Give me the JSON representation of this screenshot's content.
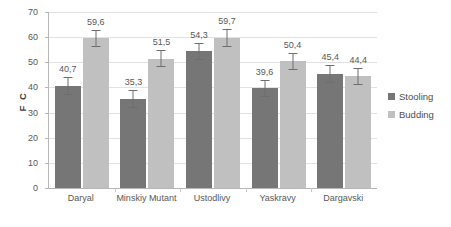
{
  "chart_data": {
    "type": "bar",
    "title": "",
    "xlabel": "",
    "ylabel": "F C",
    "ylim": [
      0,
      70
    ],
    "ytick_step": 10,
    "yticks": [
      0,
      10,
      20,
      30,
      40,
      50,
      60,
      70
    ],
    "ytick_labels": [
      "0",
      "10",
      "20",
      "30",
      "40",
      "50",
      "60",
      "70"
    ],
    "grid": true,
    "grid_axis": "y",
    "legend_position": "right",
    "decimal_separator": ",",
    "categories": [
      "Daryal",
      "Minskiy Mutant",
      "Ustodlivy",
      "Yaskravy",
      "Dargavski"
    ],
    "series": [
      {
        "name": "Stooling",
        "color": "#767676",
        "values": [
          40.7,
          35.3,
          54.3,
          39.6,
          45.4
        ],
        "labels": [
          "40,7",
          "35,3",
          "54,3",
          "39,6",
          "45,4"
        ],
        "errors": [
          3.6,
          3.5,
          3.5,
          3.4,
          3.6
        ]
      },
      {
        "name": "Budding",
        "color": "#c0c0c0",
        "values": [
          59.6,
          51.5,
          59.7,
          50.4,
          44.4
        ],
        "labels": [
          "59,6",
          "51,5",
          "59,7",
          "50,4",
          "44,4"
        ],
        "errors": [
          3.4,
          3.4,
          3.6,
          3.3,
          3.5
        ]
      }
    ]
  },
  "legend": {
    "items": [
      {
        "label": "Stooling",
        "marker": "square-marker-dark"
      },
      {
        "label": "Budding",
        "marker": "square-marker-light"
      }
    ]
  },
  "colors": {
    "series_stooling": "#767676",
    "series_budding": "#c0c0c0",
    "gridline": "#e2e2e2",
    "axis": "#b7b7b7",
    "text": "#585858",
    "background": "#ffffff"
  }
}
